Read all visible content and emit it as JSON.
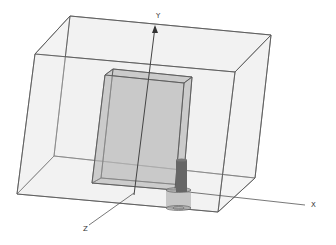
{
  "scene": {
    "background": "#ffffff",
    "edge_color": "#555555",
    "outer_box": {
      "fill": "#e6e6e6",
      "front": [
        [
          35,
          54
        ],
        [
          235,
          72
        ],
        [
          218,
          212
        ],
        [
          17,
          194
        ]
      ],
      "back": [
        [
          70,
          16
        ],
        [
          271,
          35
        ],
        [
          255,
          178
        ],
        [
          54,
          156
        ]
      ]
    },
    "inner_box": {
      "fill": "#b8b8b8",
      "front": [
        [
          105,
          75
        ],
        [
          184,
          83
        ],
        [
          175,
          190
        ],
        [
          92,
          183
        ]
      ],
      "back": [
        [
          113,
          69
        ],
        [
          192,
          77
        ],
        [
          183,
          185
        ],
        [
          101,
          178
        ]
      ]
    },
    "feed_pin": {
      "color": "#666666",
      "top": 160,
      "bottom": 192,
      "left": 176,
      "right": 187
    },
    "connector": {
      "color": "#a8a8a8",
      "left": 166,
      "right": 191,
      "top": 190,
      "bottom": 208
    }
  },
  "axes": {
    "x": {
      "label": "X",
      "from": [
        170,
        190
      ],
      "to": [
        305,
        205
      ],
      "label_pos": [
        311,
        207
      ]
    },
    "y": {
      "label": "Y",
      "from": [
        134,
        195
      ],
      "to": [
        155,
        27
      ],
      "label_pos": [
        156,
        18
      ]
    },
    "z": {
      "label": "Z",
      "from": [
        134,
        193
      ],
      "to": [
        89,
        225
      ],
      "label_pos": [
        83,
        231
      ]
    }
  }
}
